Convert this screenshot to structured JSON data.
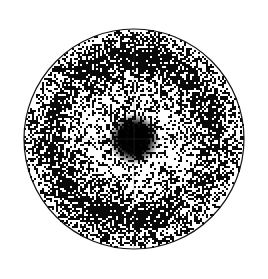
{
  "figure": {
    "title": "",
    "caption": "",
    "background_color": "#ffffff",
    "ink_color": "#000000",
    "width": 268,
    "height": 279
  },
  "chart_data": {
    "type": "heatmap",
    "render_style": "halftone-dither-polar-density",
    "title": "",
    "subtitle": "",
    "xlabel": "",
    "ylabel": "",
    "grid": false,
    "legend": false,
    "legend_position": "none",
    "annotations": [],
    "projection": "polar",
    "geometry": {
      "center_x": 134,
      "center_y": 139,
      "outer_radius": 110,
      "rim_stroke_color": "#111111",
      "rim_stroke_width": 1.2,
      "clip_to_circle": true
    },
    "axes_overlay": {
      "vertical_meridian": true,
      "horizontal_meridian": true,
      "meridian_color": "#555555",
      "meridian_opacity": 0.3,
      "meridian_width": 0.9
    },
    "colormap": {
      "name": "grayscale-inverted",
      "low_density_color": "#ffffff",
      "high_density_color": "#000000"
    },
    "radial_profile": {
      "r_unit": "fraction_of_outer_radius",
      "value_unit": "normalized_dot_density",
      "r": [
        0.0,
        0.05,
        0.1,
        0.13,
        0.16,
        0.2,
        0.26,
        0.32,
        0.38,
        0.44,
        0.5,
        0.56,
        0.62,
        0.68,
        0.74,
        0.8,
        0.86,
        0.92,
        0.96,
        1.0
      ],
      "density": [
        1.0,
        1.0,
        0.98,
        0.86,
        0.62,
        0.44,
        0.37,
        0.34,
        0.33,
        0.35,
        0.4,
        0.5,
        0.63,
        0.74,
        0.78,
        0.72,
        0.58,
        0.46,
        0.42,
        0.4
      ]
    },
    "features": [
      {
        "name": "central-spot",
        "kind": "filled-disc",
        "center_r": 0.0,
        "center_theta_deg": 0,
        "radius_fraction": 0.155,
        "peak_density": 1.0,
        "label": "central maximum"
      },
      {
        "name": "inner-bright-halo",
        "kind": "annulus",
        "r_inner": 0.18,
        "r_outer": 0.46,
        "density": 0.34,
        "label": "low-intensity halo"
      },
      {
        "name": "outer-dark-ring",
        "kind": "annulus",
        "r_inner": 0.55,
        "r_outer": 0.86,
        "density": 0.76,
        "label": "first-order intensity ring"
      },
      {
        "name": "rim-bright-margin",
        "kind": "annulus",
        "r_inner": 0.9,
        "r_outer": 1.0,
        "density": 0.42,
        "label": "outer margin"
      }
    ],
    "azimuthal_modulation": {
      "enabled": true,
      "harmonic_order": 2,
      "amplitude": 0.1,
      "phase_deg": 105,
      "note": "ring is slightly stronger near upper-left / lower-right"
    },
    "noise": {
      "type": "binary-dither",
      "grain_px": 1.6,
      "seed": 20250117
    },
    "axis_ranges": {
      "r": [
        0,
        1
      ],
      "theta_deg": [
        0,
        360
      ]
    },
    "tick_labels": {
      "radial": [],
      "azimuthal": []
    },
    "value_range": [
      0.0,
      1.0
    ]
  }
}
